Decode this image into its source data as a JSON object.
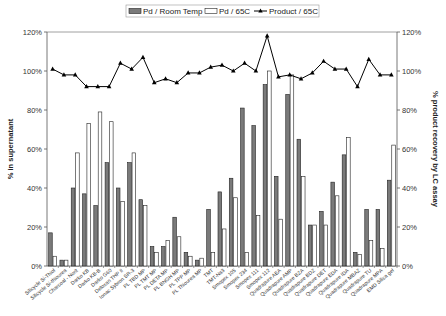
{
  "chart_data": {
    "type": "bar",
    "title": "",
    "ylabel": "% in supernatant",
    "y2label": "% product recovery by LC assay",
    "ylim": [
      0,
      120
    ],
    "y2lim": [
      0,
      120
    ],
    "yticks": [
      "0%",
      "20%",
      "40%",
      "60%",
      "80%",
      "100%",
      "120%"
    ],
    "legend_position": "top",
    "categories": [
      "Silicycle Si-Thiol",
      "Silicycle Si-thiourea",
      "Charcoal - Norit",
      "Darko KB",
      "Darko KB-B",
      "Darko G60",
      "Deloxan THP II",
      "Ionac Sybron SR-3",
      "PL TBD MP",
      "PL TMT MP",
      "PL DETA MP",
      "PL BNGH MP",
      "PL TPP MP",
      "PL Thiourea MP",
      "TMT",
      "TMT-Na3",
      "Smopex 105",
      "Smopex 234",
      "Smopex 111",
      "Smopex 112",
      "Quadrapure AEA",
      "Quadrapure AMP",
      "Quadrapure BZA",
      "Quadrapure BDZ",
      "Quadrapure DET",
      "Quadrapure EDA",
      "Quadrapure IDA",
      "Quadrapure MBAZ",
      "Quadrapure TU",
      "Quadrapure MPA",
      "EMD Silica gel"
    ],
    "series": [
      {
        "name": "Pd / Room Temp",
        "type": "bar",
        "axis": "left",
        "color": "#7a7a7a",
        "values": [
          17,
          3,
          40,
          37,
          31,
          53,
          40,
          53,
          34,
          10,
          10,
          25,
          7,
          3,
          29,
          38,
          45,
          81,
          72,
          93,
          46,
          88,
          65,
          21,
          28,
          43,
          57,
          7,
          29,
          29,
          44
        ]
      },
      {
        "name": "Pd / 65C",
        "type": "bar",
        "axis": "left",
        "color": "#ffffff",
        "values": [
          5,
          3,
          58,
          73,
          79,
          74,
          33,
          58,
          31,
          7,
          13,
          15,
          5,
          4,
          7,
          19,
          35,
          7,
          26,
          100,
          24,
          98,
          46,
          21,
          21,
          36,
          66,
          6,
          13,
          9,
          62
        ]
      },
      {
        "name": "Product / 65C",
        "type": "line",
        "axis": "right",
        "color": "#000000",
        "values": [
          101,
          98,
          98,
          92,
          92,
          92,
          104,
          101,
          107,
          94,
          96,
          94,
          99,
          99,
          102,
          103,
          100,
          104,
          100,
          118,
          97,
          98,
          96,
          99,
          105,
          101,
          101,
          92,
          106,
          98,
          98
        ]
      }
    ]
  }
}
